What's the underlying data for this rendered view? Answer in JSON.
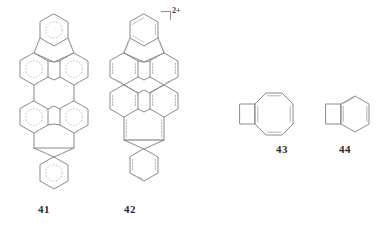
{
  "figure": {
    "kind": "chemical-structure-panel",
    "background_color": "#ffffff",
    "line_color": "#8a8a8a",
    "aromatic_ring_style": "dotted-circle",
    "structure_count": 4
  },
  "charge": {
    "bracket": "⌝",
    "value": "2+",
    "applies_to": "42"
  },
  "structures": [
    {
      "id": "41",
      "label": "41",
      "name": "diindenochrysene-type neutral hydrocarbon",
      "notation": "dotted aromatic circles",
      "ring_count": 8,
      "position": {
        "x": 14,
        "y": 12,
        "width": 80,
        "height": 186
      }
    },
    {
      "id": "42",
      "label": "42",
      "name": "diindenochrysene dication",
      "notation": "localized double bonds",
      "charge": "2+",
      "ring_count": 8,
      "position": {
        "x": 104,
        "y": 12,
        "width": 80,
        "height": 186
      }
    },
    {
      "id": "43",
      "label": "43",
      "name": "cyclobutadiene-fused cyclooctatetraene",
      "notation": "localized double bonds",
      "ring_count": 2,
      "position": {
        "x": 237,
        "y": 88,
        "width": 70,
        "height": 52
      }
    },
    {
      "id": "44",
      "label": "44",
      "name": "benzocyclobutadiene",
      "notation": "localized double bonds",
      "ring_count": 2,
      "position": {
        "x": 323,
        "y": 90,
        "width": 46,
        "height": 48
      }
    }
  ]
}
